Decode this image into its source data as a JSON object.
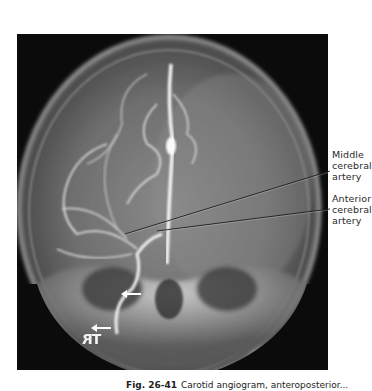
{
  "figure": {
    "type": "angiogram",
    "view": "AP skull, carotid injection",
    "marker_text": "TR",
    "labels": [
      {
        "id": "middle",
        "lines": [
          "Middle",
          "cerebral",
          "artery"
        ]
      },
      {
        "id": "anterior",
        "lines": [
          "Anterior",
          "cerebral",
          "artery"
        ]
      }
    ],
    "arrows": [
      {
        "id": "arrow-1",
        "direction": "left"
      },
      {
        "id": "arrow-2",
        "direction": "left"
      }
    ]
  },
  "caption": {
    "number": "Fig. 26-41",
    "text": "Carotid angiogram, anteroposterior..."
  },
  "colors": {
    "background": "#ffffff",
    "film": "#0b0b0b",
    "leader_line": "#1a1a1a",
    "text": "#2a2a2a"
  }
}
